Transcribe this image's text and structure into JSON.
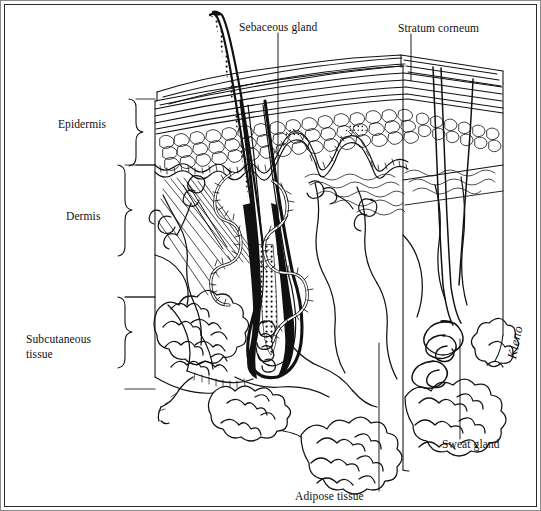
{
  "figure": {
    "signature": "Kleno",
    "ink_color": "#111111",
    "background_color": "#ffffff",
    "border_color": "#2b2b2b"
  },
  "labels": {
    "sebaceous_gland": "Sebaceous gland",
    "stratum_corneum": "Stratum corneum",
    "epidermis": "Epidermis",
    "dermis": "Dermis",
    "subcutaneous_tissue_line1": "Subcutaneous",
    "subcutaneous_tissue_line2": "tissue",
    "sweat_gland": "Sweat gland",
    "adipose_tissue": "Adipose tissue"
  },
  "structures": [
    {
      "name": "hair-shaft",
      "region": "above-surface"
    },
    {
      "name": "hair-follicle",
      "region": "dermis"
    },
    {
      "name": "hair-bulb",
      "region": "dermis-subcutaneous-boundary"
    },
    {
      "name": "sebaceous-gland",
      "region": "dermis"
    },
    {
      "name": "sweat-gland-coil",
      "region": "subcutaneous"
    },
    {
      "name": "sweat-duct",
      "region": "epidermis-dermis"
    },
    {
      "name": "adipose-lobules",
      "region": "subcutaneous"
    },
    {
      "name": "blood-vessels",
      "region": "dermis"
    },
    {
      "name": "nerve-endings",
      "region": "dermis"
    },
    {
      "name": "stratum-corneum-lamellae",
      "region": "epidermis"
    },
    {
      "name": "basal-cell-layer",
      "region": "epidermis"
    },
    {
      "name": "dermal-papillae",
      "region": "epidermis-dermis-junction"
    }
  ],
  "brackets": [
    {
      "name": "epidermis-bracket",
      "layer": "Epidermis"
    },
    {
      "name": "dermis-bracket",
      "layer": "Dermis"
    },
    {
      "name": "subcutaneous-bracket",
      "layer": "Subcutaneous tissue"
    }
  ]
}
